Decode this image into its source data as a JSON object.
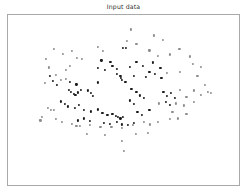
{
  "figure": {
    "title": "Input data",
    "background_color": "#ffffff",
    "frame_color": "#a9a9a9"
  },
  "chart_data": {
    "type": "scatter",
    "title": "Input data",
    "xlabel": "",
    "ylabel": "",
    "xlim": [
      0,
      1
    ],
    "ylim": [
      0,
      1
    ],
    "grid": false,
    "legend": null,
    "axis_ticks_visible": false,
    "marker": {
      "shape": "circle",
      "size_px": 2.2
    },
    "series": [
      {
        "name": "dark-points",
        "color": "#1a1a1a",
        "points": [
          [
            0.499,
            0.807
          ],
          [
            0.51,
            0.805
          ],
          [
            0.404,
            0.733
          ],
          [
            0.443,
            0.726
          ],
          [
            0.452,
            0.7
          ],
          [
            0.388,
            0.688
          ],
          [
            0.42,
            0.679
          ],
          [
            0.47,
            0.684
          ],
          [
            0.529,
            0.697
          ],
          [
            0.556,
            0.726
          ],
          [
            0.585,
            0.702
          ],
          [
            0.628,
            0.721
          ],
          [
            0.66,
            0.69
          ],
          [
            0.612,
            0.665
          ],
          [
            0.47,
            0.653
          ],
          [
            0.487,
            0.641
          ],
          [
            0.489,
            0.628
          ],
          [
            0.494,
            0.617
          ],
          [
            0.508,
            0.607
          ],
          [
            0.545,
            0.64
          ],
          [
            0.597,
            0.636
          ],
          [
            0.636,
            0.653
          ],
          [
            0.664,
            0.628
          ],
          [
            0.268,
            0.605
          ],
          [
            0.296,
            0.592
          ],
          [
            0.388,
            0.603
          ],
          [
            0.265,
            0.56
          ],
          [
            0.274,
            0.546
          ],
          [
            0.284,
            0.538
          ],
          [
            0.292,
            0.529
          ],
          [
            0.303,
            0.545
          ],
          [
            0.316,
            0.56
          ],
          [
            0.345,
            0.556
          ],
          [
            0.358,
            0.54
          ],
          [
            0.369,
            0.522
          ],
          [
            0.534,
            0.566
          ],
          [
            0.556,
            0.548
          ],
          [
            0.571,
            0.527
          ],
          [
            0.588,
            0.512
          ],
          [
            0.529,
            0.498
          ],
          [
            0.544,
            0.478
          ],
          [
            0.673,
            0.548
          ],
          [
            0.688,
            0.522
          ],
          [
            0.704,
            0.54
          ],
          [
            0.722,
            0.512
          ],
          [
            0.683,
            0.487
          ],
          [
            0.7,
            0.47
          ],
          [
            0.228,
            0.492
          ],
          [
            0.245,
            0.478
          ],
          [
            0.26,
            0.462
          ],
          [
            0.288,
            0.452
          ],
          [
            0.306,
            0.47
          ],
          [
            0.33,
            0.44
          ],
          [
            0.36,
            0.433
          ],
          [
            0.388,
            0.445
          ],
          [
            0.409,
            0.424
          ],
          [
            0.43,
            0.412
          ],
          [
            0.452,
            0.42
          ],
          [
            0.466,
            0.408
          ],
          [
            0.476,
            0.4
          ],
          [
            0.487,
            0.392
          ],
          [
            0.498,
            0.402
          ],
          [
            0.56,
            0.432
          ],
          [
            0.58,
            0.412
          ],
          [
            0.612,
            0.444
          ],
          [
            0.416,
            0.366
          ],
          [
            0.44,
            0.358
          ],
          [
            0.472,
            0.372
          ],
          [
            0.492,
            0.356
          ],
          [
            0.52,
            0.352
          ],
          [
            0.545,
            0.366
          ],
          [
            0.302,
            0.38
          ],
          [
            0.33,
            0.392
          ],
          [
            0.356,
            0.378
          ],
          [
            0.18,
            0.64
          ],
          [
            0.196,
            0.612
          ],
          [
            0.212,
            0.588
          ]
        ]
      },
      {
        "name": "light-points",
        "color": "#8c8c8c",
        "points": [
          [
            0.531,
            0.915
          ],
          [
            0.632,
            0.88
          ],
          [
            0.67,
            0.852
          ],
          [
            0.516,
            0.848
          ],
          [
            0.556,
            0.832
          ],
          [
            0.2,
            0.8
          ],
          [
            0.236,
            0.772
          ],
          [
            0.276,
            0.788
          ],
          [
            0.388,
            0.812
          ],
          [
            0.412,
            0.788
          ],
          [
            0.742,
            0.8
          ],
          [
            0.7,
            0.768
          ],
          [
            0.788,
            0.756
          ],
          [
            0.164,
            0.74
          ],
          [
            0.3,
            0.748
          ],
          [
            0.32,
            0.74
          ],
          [
            0.176,
            0.692
          ],
          [
            0.8,
            0.712
          ],
          [
            0.836,
            0.696
          ],
          [
            0.744,
            0.664
          ],
          [
            0.688,
            0.66
          ],
          [
            0.208,
            0.648
          ],
          [
            0.82,
            0.64
          ],
          [
            0.16,
            0.6
          ],
          [
            0.852,
            0.588
          ],
          [
            0.804,
            0.556
          ],
          [
            0.864,
            0.548
          ],
          [
            0.836,
            0.532
          ],
          [
            0.88,
            0.54
          ],
          [
            0.228,
            0.616
          ],
          [
            0.252,
            0.624
          ],
          [
            0.744,
            0.56
          ],
          [
            0.772,
            0.516
          ],
          [
            0.652,
            0.48
          ],
          [
            0.728,
            0.48
          ],
          [
            0.76,
            0.468
          ],
          [
            0.806,
            0.49
          ],
          [
            0.172,
            0.452
          ],
          [
            0.185,
            0.444
          ],
          [
            0.197,
            0.44
          ],
          [
            0.148,
            0.4
          ],
          [
            0.14,
            0.38
          ],
          [
            0.206,
            0.39
          ],
          [
            0.232,
            0.37
          ],
          [
            0.276,
            0.358
          ],
          [
            0.296,
            0.35
          ],
          [
            0.312,
            0.348
          ],
          [
            0.356,
            0.352
          ],
          [
            0.4,
            0.344
          ],
          [
            0.448,
            0.342
          ],
          [
            0.492,
            0.336
          ],
          [
            0.54,
            0.352
          ],
          [
            0.588,
            0.372
          ],
          [
            0.616,
            0.356
          ],
          [
            0.648,
            0.37
          ],
          [
            0.7,
            0.388
          ],
          [
            0.736,
            0.392
          ],
          [
            0.604,
            0.308
          ],
          [
            0.552,
            0.3
          ],
          [
            0.492,
            0.26
          ],
          [
            0.5,
            0.2
          ],
          [
            0.42,
            0.296
          ],
          [
            0.34,
            0.3
          ],
          [
            0.712,
            0.432
          ],
          [
            0.772,
            0.42
          ],
          [
            0.268,
            0.7
          ],
          [
            0.252,
            0.676
          ],
          [
            0.612,
            0.792
          ],
          [
            0.648,
            0.76
          ]
        ]
      }
    ],
    "point_count": 145
  }
}
